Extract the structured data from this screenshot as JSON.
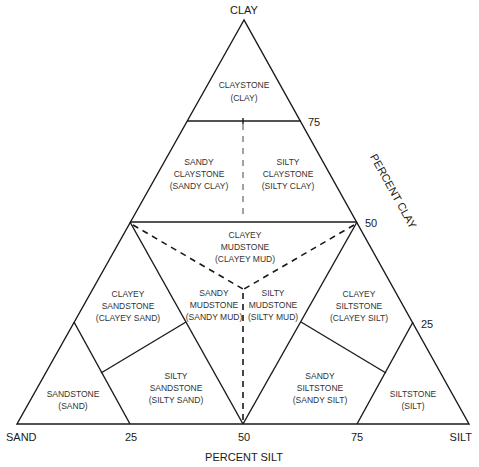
{
  "diagram": {
    "type": "ternary-classification",
    "vertices": {
      "top": "CLAY",
      "left": "SAND",
      "right": "SILT"
    },
    "axis_titles": {
      "bottom": "PERCENT SILT",
      "right": "PERCENT CLAY"
    },
    "bottom_ticks": [
      "25",
      "50",
      "75"
    ],
    "right_ticks": [
      "75",
      "50",
      "25"
    ],
    "regions": [
      {
        "id": "claystone",
        "lines": [
          "CLAYSTONE",
          "(CLAY)"
        ]
      },
      {
        "id": "sandy-claystone",
        "lines": [
          "SANDY",
          "CLAYSTONE",
          "(SANDY CLAY)"
        ]
      },
      {
        "id": "silty-claystone",
        "lines": [
          "SILTY",
          "CLAYSTONE",
          "(SILTY CLAY)"
        ]
      },
      {
        "id": "clayey-mudstone",
        "lines": [
          "CLAYEY",
          "MUDSTONE",
          "(CLAYEY MUD)"
        ]
      },
      {
        "id": "clayey-sandstone",
        "lines": [
          "CLAYEY",
          "SANDSTONE",
          "(CLAYEY SAND)"
        ]
      },
      {
        "id": "sandy-mudstone",
        "lines": [
          "SANDY",
          "MUDSTONE",
          "(SANDY MUD)"
        ]
      },
      {
        "id": "silty-mudstone",
        "lines": [
          "SILTY",
          "MUDSTONE",
          "(SILTY MUD)"
        ]
      },
      {
        "id": "clayey-siltstone",
        "lines": [
          "CLAYEY",
          "SILTSTONE",
          "(CLAYEY SILT)"
        ]
      },
      {
        "id": "sandstone",
        "lines": [
          "SANDSTONE",
          "(SAND)"
        ]
      },
      {
        "id": "silty-sandstone",
        "lines": [
          "SILTY",
          "SANDSTONE",
          "(SILTY SAND)"
        ]
      },
      {
        "id": "sandy-siltstone",
        "lines": [
          "SANDY",
          "SILTSTONE",
          "(SANDY SILT)"
        ]
      },
      {
        "id": "siltstone",
        "lines": [
          "SILTSTONE",
          "(SILT)"
        ]
      }
    ]
  }
}
